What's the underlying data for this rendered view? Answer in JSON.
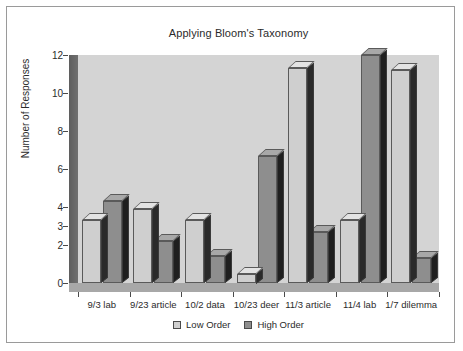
{
  "chart_data": {
    "type": "bar",
    "title": "Applying Bloom's Taxonomy",
    "xlabel": "",
    "ylabel": "Number of Responses",
    "ylim": [
      0,
      12
    ],
    "yticks": [
      0,
      2,
      3,
      4,
      6,
      8,
      10,
      12
    ],
    "grid": false,
    "legend_position": "bottom",
    "categories": [
      "9/3 lab",
      "9/23 article",
      "10/2 data",
      "10/23 deer",
      "11/3 article",
      "11/4 lab",
      "1/7 dilemma"
    ],
    "series": [
      {
        "name": "Low Order",
        "color": "#cfcfcf",
        "values": [
          3.3,
          3.9,
          3.3,
          0.5,
          11.3,
          3.3,
          11.2
        ]
      },
      {
        "name": "High Order",
        "color": "#8e8e8e",
        "values": [
          4.3,
          2.2,
          1.4,
          6.7,
          2.7,
          12.0,
          1.3
        ]
      }
    ]
  },
  "legend": {
    "items": [
      {
        "label": "Low Order"
      },
      {
        "label": "High Order"
      }
    ]
  }
}
